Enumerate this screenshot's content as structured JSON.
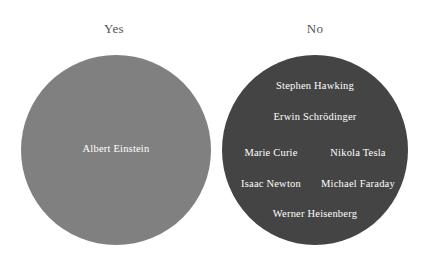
{
  "chart_data": {
    "type": "pie",
    "title": "",
    "subtitle": "",
    "xlabel": "",
    "ylabel": "",
    "legend_position": "none",
    "grid": false,
    "categories": [
      "Yes",
      "No"
    ],
    "values": [
      1,
      7
    ],
    "colors": [
      "#808080",
      "#444444"
    ],
    "groups": [
      {
        "label": "Yes",
        "color": "#808080",
        "count": 1,
        "members": [
          "Albert Einstein"
        ]
      },
      {
        "label": "No",
        "color": "#444444",
        "count": 7,
        "members": [
          "Stephen Hawking",
          "Erwin Schrödinger",
          "Marie Curie",
          "Nikola Tesla",
          "Isaac Newton",
          "Michael Faraday",
          "Werner Heisenberg"
        ]
      }
    ]
  },
  "headers": {
    "yes": "Yes",
    "no": "No"
  },
  "yes_group": {
    "members": {
      "einstein": "Albert Einstein"
    }
  },
  "no_group": {
    "members": {
      "hawking": "Stephen Hawking",
      "schrodinger": "Erwin Schrödinger",
      "curie": "Marie Curie",
      "tesla": "Nikola Tesla",
      "newton": "Isaac Newton",
      "faraday": "Michael Faraday",
      "heisenberg": "Werner Heisenberg"
    }
  },
  "colors": {
    "background": "#ffffff",
    "yes_circle": "#808080",
    "no_circle": "#444444",
    "header_text": "#555555",
    "member_text": "#ffffff"
  }
}
